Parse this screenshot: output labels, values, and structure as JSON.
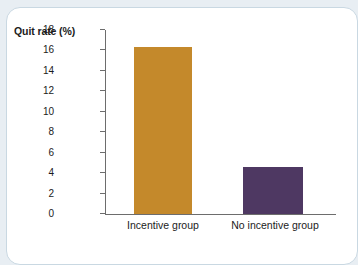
{
  "chart_data": {
    "type": "bar",
    "title": "",
    "subtitle": "",
    "xlabel": "",
    "ylabel": "Quit rate (%)",
    "categories": [
      "Incentive group",
      "No incentive group"
    ],
    "values": [
      16.3,
      4.6
    ],
    "series": [
      {
        "name": "Quit rate",
        "values": [
          16.3,
          4.6
        ]
      }
    ],
    "ylim": [
      0,
      18
    ],
    "yticks": [
      "0",
      "2",
      "4",
      "6",
      "8",
      "10",
      "12",
      "14",
      "16",
      "18"
    ],
    "ytick_values": [
      0,
      2,
      4,
      6,
      8,
      10,
      12,
      14,
      16,
      18
    ],
    "grid": false,
    "legend": false,
    "legend_position": "none",
    "bar_colors": [
      "#c4892b",
      "#4e3862"
    ],
    "annotations": []
  },
  "figure": {
    "card_background": "#ffffff",
    "page_background": "#e8eef3",
    "border_color": "#c9d8e2",
    "axis_color": "#6d6d6d",
    "text_color": "#1b1b1b"
  }
}
